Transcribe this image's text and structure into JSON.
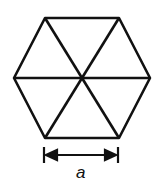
{
  "diagram": {
    "shape": "regular hexagon divided into six equilateral triangles",
    "dimension_label": "a",
    "stroke_color": "#111111",
    "background": "#ffffff"
  }
}
